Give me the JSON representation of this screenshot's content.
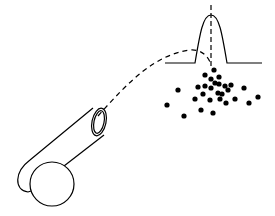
{
  "diagram": {
    "colors": {
      "stroke": "#000000",
      "background": "#ffffff",
      "dot": "#000000"
    },
    "cannon": {
      "wheel": {
        "cx": 52,
        "cy": 184,
        "r": 22
      },
      "muzzle": {
        "cx": 99,
        "cy": 122,
        "rx": 7,
        "ry": 14
      }
    },
    "trajectory": {
      "style": "dashed",
      "path": "M98,116 C130,80 155,55 190,50 C200,49 207,55 210,62"
    },
    "distribution_curve": {
      "baseline_y": 63,
      "left_x": 165,
      "right_x": 262,
      "peak_x": 211,
      "peak_y": 15,
      "center_line_x": 211
    },
    "impact_points": [
      [
        214,
        70
      ],
      [
        205,
        75
      ],
      [
        219,
        77
      ],
      [
        211,
        79
      ],
      [
        215,
        83
      ],
      [
        198,
        87
      ],
      [
        205,
        86
      ],
      [
        211,
        88
      ],
      [
        219,
        84
      ],
      [
        225,
        86
      ],
      [
        231,
        85
      ],
      [
        178,
        90
      ],
      [
        244,
        88
      ],
      [
        203,
        94
      ],
      [
        218,
        93
      ],
      [
        222,
        94
      ],
      [
        228,
        90
      ],
      [
        195,
        99
      ],
      [
        210,
        100
      ],
      [
        220,
        99
      ],
      [
        226,
        103
      ],
      [
        235,
        99
      ],
      [
        258,
        97
      ],
      [
        249,
        103
      ],
      [
        167,
        105
      ],
      [
        201,
        110
      ],
      [
        213,
        113
      ],
      [
        184,
        116
      ]
    ]
  }
}
